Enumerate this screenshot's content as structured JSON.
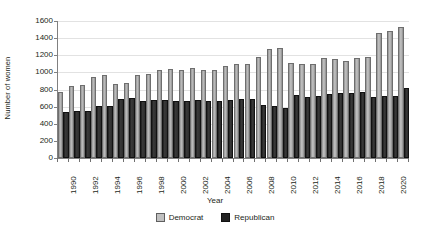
{
  "chart_data": {
    "type": "bar",
    "title": "",
    "xlabel": "Year",
    "ylabel": "Number of women",
    "ylim": [
      0,
      1600
    ],
    "ytick_step": 200,
    "yticks": [
      0,
      200,
      400,
      600,
      800,
      1000,
      1200,
      1400,
      1600
    ],
    "grid": true,
    "legend_position": "bottom",
    "xtick_labels": [
      "1990",
      "1992",
      "1994",
      "1996",
      "1998",
      "2000",
      "2002",
      "2004",
      "2006",
      "2008",
      "2010",
      "2012",
      "2014",
      "2016",
      "2018",
      "2020"
    ],
    "categories": [
      "1990",
      "1991",
      "1992",
      "1993",
      "1994",
      "1995",
      "1996",
      "1997",
      "1998",
      "1999",
      "2000",
      "2001",
      "2002",
      "2003",
      "2004",
      "2005",
      "2006",
      "2007",
      "2008",
      "2009",
      "2010",
      "2011",
      "2012",
      "2013",
      "2014",
      "2015",
      "2016",
      "2017",
      "2018",
      "2019",
      "2020",
      "2021"
    ],
    "series": [
      {
        "name": "Democrat",
        "color": "#b3b3b3",
        "values": [
          745,
          820,
          825,
          925,
          950,
          840,
          850,
          945,
          955,
          1000,
          1015,
          1010,
          1025,
          1005,
          1010,
          1050,
          1080,
          1080,
          1155,
          1255,
          1265,
          1090,
          1080,
          1080,
          1140,
          1135,
          1110,
          1145,
          1155,
          1440,
          1465,
          1510
        ]
      },
      {
        "name": "Republican",
        "color": "#222222",
        "values": [
          510,
          525,
          530,
          585,
          580,
          670,
          680,
          640,
          650,
          650,
          645,
          645,
          650,
          640,
          645,
          650,
          665,
          670,
          590,
          585,
          555,
          715,
          690,
          700,
          730,
          735,
          740,
          745,
          690,
          700,
          700,
          790
        ]
      }
    ]
  },
  "legend": {
    "democrat_label": "Democrat",
    "republican_label": "Republican"
  }
}
